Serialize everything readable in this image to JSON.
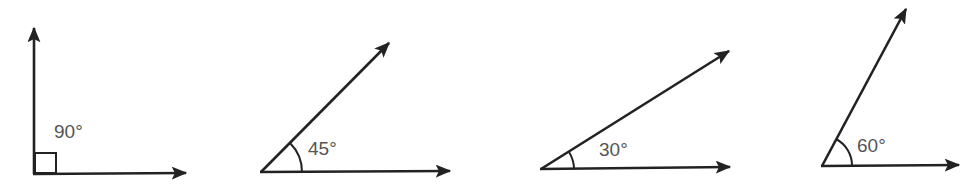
{
  "colors": {
    "stroke": "#222222",
    "label": "#555555",
    "background": "#ffffff"
  },
  "angles": [
    {
      "id": "angle-90",
      "degrees": 90,
      "label": "90°",
      "marker": "right-angle-square",
      "vertex": [
        34,
        174
      ],
      "ray_tip": [
        34,
        26
      ],
      "base_tip": [
        188,
        173
      ],
      "label_pos": [
        54,
        138
      ]
    },
    {
      "id": "angle-45",
      "degrees": 45,
      "label": "45°",
      "marker": "arc",
      "vertex": [
        261,
        172
      ],
      "ray_tip": [
        391,
        41
      ],
      "base_tip": [
        452,
        171
      ],
      "label_pos": [
        308,
        155
      ]
    },
    {
      "id": "angle-30",
      "degrees": 30,
      "label": "30°",
      "marker": "arc",
      "vertex": [
        541,
        169
      ],
      "ray_tip": [
        731,
        50
      ],
      "base_tip": [
        732,
        167
      ],
      "label_pos": [
        599,
        156
      ]
    },
    {
      "id": "angle-60",
      "degrees": 60,
      "label": "60°",
      "marker": "arc",
      "vertex": [
        822,
        166
      ],
      "ray_tip": [
        907,
        7
      ],
      "base_tip": [
        961,
        165
      ],
      "label_pos": [
        857,
        152
      ]
    }
  ]
}
